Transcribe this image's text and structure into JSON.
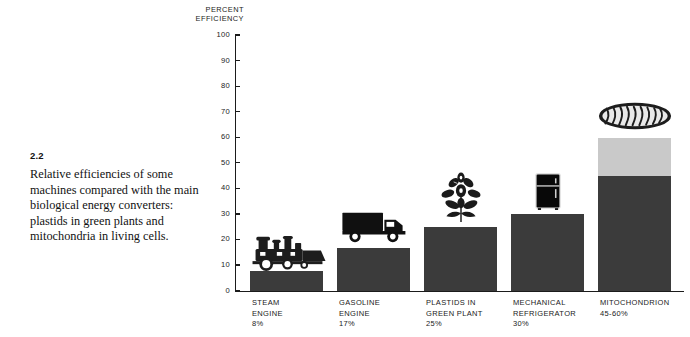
{
  "figure": {
    "number": "2.2",
    "caption": "Relative efficiencies of some machines compared with the main biological energy converters: plastids in green plants and mitochondria in living cells."
  },
  "chart_data": {
    "type": "bar",
    "title": "",
    "axis_title": "PERCENT\nEFFICIENCY",
    "xlabel": "",
    "ylabel": "PERCENT EFFICIENCY",
    "ylim": [
      0,
      100
    ],
    "ytick_labels": [
      "100",
      "90",
      "80",
      "70",
      "60",
      "50",
      "40",
      "30",
      "20",
      "10",
      "0"
    ],
    "ytick_values": [
      100,
      90,
      80,
      70,
      60,
      50,
      40,
      30,
      20,
      10,
      0
    ],
    "grid": false,
    "legend": false,
    "categories": [
      "STEAM ENGINE",
      "GASOLINE ENGINE",
      "PLASTIDS IN GREEN PLANT",
      "MECHANICAL REFRIGERATOR",
      "MITOCHONDRION"
    ],
    "values": [
      8,
      17,
      25,
      30,
      60
    ],
    "bars": [
      {
        "label_line1": "STEAM",
        "label_line2": "ENGINE",
        "value_label": "8%",
        "value": 8,
        "value_low": 8,
        "value_high": 8,
        "icon": "steam-locomotive-icon"
      },
      {
        "label_line1": "GASOLINE",
        "label_line2": "ENGINE",
        "value_label": "17%",
        "value": 17,
        "value_low": 17,
        "value_high": 17,
        "icon": "delivery-truck-icon"
      },
      {
        "label_line1": "PLASTIDS IN",
        "label_line2": "GREEN PLANT",
        "value_label": "25%",
        "value": 25,
        "value_low": 25,
        "value_high": 25,
        "icon": "green-plant-icon"
      },
      {
        "label_line1": "MECHANICAL",
        "label_line2": "REFRIGERATOR",
        "value_label": "30%",
        "value": 30,
        "value_low": 30,
        "value_high": 30,
        "icon": "refrigerator-icon"
      },
      {
        "label_line1": "MITOCHONDRION",
        "label_line2": "",
        "value_label": "45-60%",
        "value": 60,
        "value_low": 45,
        "value_high": 60,
        "icon": "mitochondrion-icon"
      }
    ]
  },
  "colors": {
    "bar_dark": "#3b3b3b",
    "bar_light": "#c9c9c9",
    "axis": "#1b1b1b",
    "text": "#1b1b1b",
    "background": "#ffffff"
  }
}
